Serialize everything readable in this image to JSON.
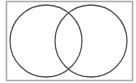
{
  "diagram": {
    "type": "venn",
    "sets": 2,
    "colors": {
      "border": "#a9a9a9",
      "circle": "#555555",
      "background": "#ffffff"
    },
    "universe": {
      "x": 6.5,
      "y": 1.5,
      "width": 126,
      "height": 79
    },
    "circles": [
      {
        "name": "set-a",
        "cx": 46,
        "cy": 41,
        "r": 36
      },
      {
        "name": "set-b",
        "cx": 91,
        "cy": 41,
        "r": 36
      }
    ]
  }
}
